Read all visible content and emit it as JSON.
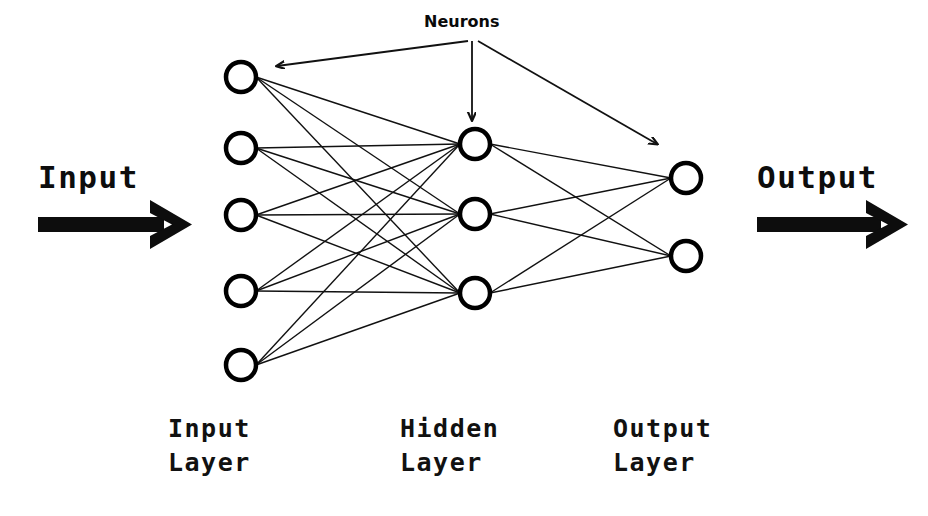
{
  "diagram": {
    "background_color": "#ffffff",
    "stroke_color": "#111111",
    "neuron_fill": "#ffffff",
    "neuron_stroke": "#000000"
  },
  "annotations": {
    "neurons_label": "Neurons",
    "input_label": "Input",
    "output_label": "Output"
  },
  "layer_captions": [
    {
      "line1": "Input",
      "line2": "Layer"
    },
    {
      "line1": "Hidden",
      "line2": "Layer"
    },
    {
      "line1": "Output",
      "line2": "Layer"
    }
  ],
  "network": {
    "layers": [
      {
        "name": "input-layer",
        "caption": "Input Layer",
        "count": 5,
        "x": 241,
        "radius": 15,
        "nodes_y": [
          77,
          148,
          215,
          291,
          365
        ]
      },
      {
        "name": "hidden-layer",
        "caption": "Hidden Layer",
        "count": 3,
        "x": 475,
        "radius": 15,
        "nodes_y": [
          144,
          214,
          293
        ]
      },
      {
        "name": "output-layer",
        "caption": "Output Layer",
        "count": 2,
        "x": 686,
        "radius": 15,
        "nodes_y": [
          178,
          256
        ]
      }
    ],
    "connections": "fully-connected",
    "connection_counts": [
      15,
      6
    ]
  },
  "pointer_arrows": [
    {
      "name": "neurons-to-input",
      "from": [
        470,
        40
      ],
      "to": [
        272,
        66
      ]
    },
    {
      "name": "neurons-to-hidden",
      "from": [
        472,
        40
      ],
      "to": [
        472,
        124
      ]
    },
    {
      "name": "neurons-to-output",
      "from": [
        476,
        40
      ],
      "to": [
        662,
        147
      ]
    }
  ],
  "flow_arrows": [
    {
      "name": "input-flow-arrow",
      "label": "Input",
      "x1": 38,
      "x2": 192,
      "y": 225
    },
    {
      "name": "output-flow-arrow",
      "label": "Output",
      "x1": 757,
      "x2": 908,
      "y": 225
    }
  ],
  "positions": {
    "input_text": {
      "left": 38,
      "top": 160
    },
    "output_text": {
      "left": 757,
      "top": 160
    },
    "neurons_text": {
      "left": 424,
      "top": 12
    },
    "caption_x": [
      168,
      400,
      613
    ],
    "caption_top": 412
  }
}
